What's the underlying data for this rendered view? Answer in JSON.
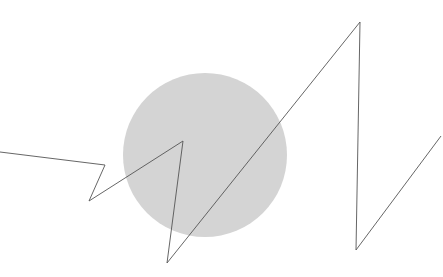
{
  "canvas": {
    "width": 443,
    "height": 277,
    "background_color": "#ffffff"
  },
  "shapes": {
    "circle": {
      "name": "gray filled circle",
      "center_x": 205,
      "center_y": 155,
      "radius": 82,
      "fill_color": "#d4d4d4",
      "stroke": "none",
      "opacity": 1
    },
    "polyline": {
      "name": "zigzag polyline",
      "stroke_color": "#555555",
      "stroke_width": 0.9,
      "fill": "none",
      "points_text": "0,152 105,165 89,201 183,141 167,263 360,22 356,250 441,136",
      "points": [
        {
          "x": 0,
          "y": 152
        },
        {
          "x": 105,
          "y": 165
        },
        {
          "x": 89,
          "y": 201
        },
        {
          "x": 183,
          "y": 141
        },
        {
          "x": 167,
          "y": 263
        },
        {
          "x": 360,
          "y": 22
        },
        {
          "x": 356,
          "y": 250
        },
        {
          "x": 441,
          "y": 136
        }
      ]
    }
  },
  "chart_data": {
    "type": "line",
    "title": "",
    "xlabel": "",
    "ylabel": "",
    "grid": false,
    "legend": "none",
    "xlim": [
      0,
      443
    ],
    "ylim": [
      0,
      277
    ],
    "series": [
      {
        "name": "zigzag",
        "x": [
          0,
          105,
          89,
          183,
          167,
          360,
          356,
          441
        ],
        "y": [
          152,
          165,
          201,
          141,
          263,
          22,
          250,
          136
        ]
      }
    ],
    "annotations": [
      {
        "type": "circle",
        "cx": 205,
        "cy": 155,
        "r": 82,
        "color": "#d4d4d4"
      }
    ]
  }
}
